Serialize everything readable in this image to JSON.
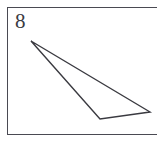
{
  "figure": {
    "label": "8",
    "background_color": "#ffffff",
    "frame": {
      "border_color": "#4a4a52",
      "border_width_px": 1.5,
      "left_px": 7,
      "top_px": 7,
      "height_px": 128,
      "right_edge_clipped": true
    },
    "shape": {
      "name": "sliver-triangle",
      "stroke_color": "#3a3a40",
      "stroke_width_px": 1.4,
      "fill": "none",
      "points": "31,41 150,112 100,119",
      "vertices": [
        {
          "name": "apex-upper-left",
          "x": 31,
          "y": 41
        },
        {
          "name": "vertex-right",
          "x": 150,
          "y": 112
        },
        {
          "name": "vertex-bottom",
          "x": 100,
          "y": 119
        }
      ]
    }
  }
}
